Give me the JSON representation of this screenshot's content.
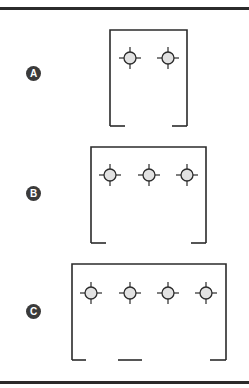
{
  "figure": {
    "top_rule_y": 7,
    "bottom_rule_y": 381,
    "colors": {
      "line": "#2b2b2b",
      "fixture_fill": "#e2e2e2",
      "label_bg": "#3a3a3a",
      "label_text": "#ffffff"
    },
    "panels": [
      {
        "label": "A",
        "label_center": [
          33,
          73
        ],
        "box": {
          "left": 110,
          "right": 187,
          "top": 30,
          "bottom": 126
        },
        "bottom_segments": [
          [
            110,
            125
          ],
          [
            172,
            187
          ]
        ],
        "fixtures_y": 58,
        "fixtures_x": [
          130,
          168
        ]
      },
      {
        "label": "B",
        "label_center": [
          33,
          193
        ],
        "box": {
          "left": 91,
          "right": 206,
          "top": 147,
          "bottom": 243
        },
        "bottom_segments": [
          [
            91,
            106
          ],
          [
            191,
            206
          ]
        ],
        "fixtures_y": 175,
        "fixtures_x": [
          110,
          149,
          187
        ]
      },
      {
        "label": "C",
        "label_center": [
          33,
          311
        ],
        "box": {
          "left": 72,
          "right": 226,
          "top": 264,
          "bottom": 360
        },
        "bottom_segments": [
          [
            72,
            86
          ],
          [
            118,
            142
          ],
          [
            210,
            226
          ]
        ],
        "fixtures_y": 293,
        "fixtures_x": [
          91,
          130,
          168,
          206
        ]
      }
    ],
    "fixture_icon": "crosshair-circle-icon"
  }
}
